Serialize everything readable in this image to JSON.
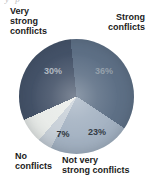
{
  "page": {
    "background": "#ffffff",
    "cropped_fragment": "y p"
  },
  "chart_data": {
    "type": "pie",
    "title": "",
    "unit": "%",
    "start_angle_deg": -6,
    "direction": "clockwise",
    "legend_position": "around",
    "label_color": "#1b1b1b",
    "slices": [
      {
        "label": "Strong\nconflicts",
        "value": 36,
        "pct": "36%",
        "color": "#5e7086",
        "pct_color": "#95a0ab"
      },
      {
        "label": "Not very\nstrong conflicts",
        "value": 23,
        "pct": "23%",
        "color": "#a4b2c2",
        "pct_color": "#343c45"
      },
      {
        "label": "",
        "value": 4,
        "pct": "",
        "color": "#c7cfd7",
        "pct_color": ""
      },
      {
        "label": "No\nconflicts",
        "value": 7,
        "pct": "7%",
        "color": "#e8ebe8",
        "pct_color": "#2e3439"
      },
      {
        "label": "Very\nstrong\nconflicts",
        "value": 30,
        "pct": "30%",
        "color": "#445268",
        "pct_color": "#b2b9c2"
      }
    ]
  }
}
